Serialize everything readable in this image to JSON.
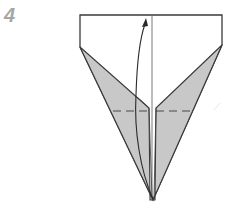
{
  "step": {
    "number": "4"
  },
  "diagram": {
    "colors": {
      "paper_white": "#ffffff",
      "paper_colored": "#c8c8c8",
      "line": "#3a3a3a",
      "step_number": "#a6a6a6"
    },
    "elements": [
      "outer-paper-outline",
      "left-folded-flap",
      "right-folded-flap",
      "center-crease",
      "valley-fold-dashed-line",
      "curved-fold-arrow"
    ]
  }
}
